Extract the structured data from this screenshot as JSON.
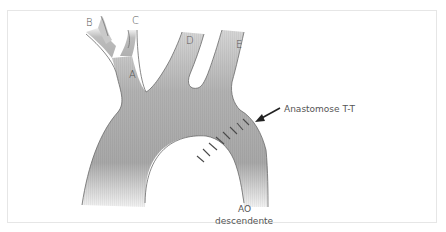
{
  "diagram": {
    "type": "anatomical-illustration",
    "colors": {
      "vessel_fill": "#b8b8b8",
      "vessel_dark": "#8f8f8f",
      "vessel_light": "#e4e4e4",
      "outline": "#6a6a6a",
      "suture": "#4a4a4a",
      "label": "#555555",
      "frame_border": "#e6e6e6"
    },
    "labels": {
      "b": "B",
      "c": "C",
      "a": "A",
      "d": "D",
      "e": "E",
      "anastomosis": "Anastomose T-T",
      "ao_line1": "AO",
      "ao_line2": "descendente"
    },
    "suture_count": 8
  }
}
